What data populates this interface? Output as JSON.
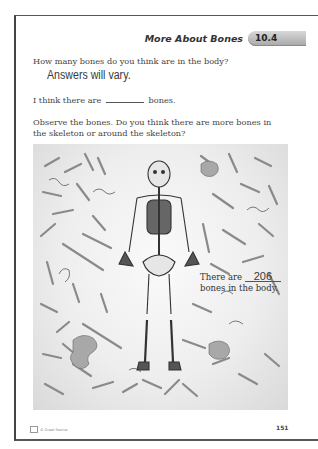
{
  "header": {
    "title": "More About Bones",
    "lesson_badge": "10.4",
    "badge_color": "#b5b5b5"
  },
  "question1": {
    "prompt": "How many bones do you think are in the body?",
    "handwritten_answer": "Answers will vary."
  },
  "fill_in": {
    "before": "I think there are",
    "after": "bones."
  },
  "question2": {
    "line1": "Observe the bones. Do you think there are more bones in",
    "line2": "the skeleton or around the skeleton?"
  },
  "illustration": {
    "subject": "human skeleton surrounded by scattered bones",
    "count_label_before": "There are",
    "count_value": "206",
    "count_label_after": "bones in the body."
  },
  "footer": {
    "copyright": "© Great Source",
    "page_number": "151"
  }
}
